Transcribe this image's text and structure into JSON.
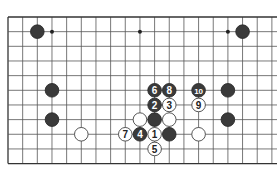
{
  "diagram": {
    "type": "go-board-fragment",
    "grid": {
      "cols": 19,
      "rows": 11,
      "x0": 8,
      "y0": 17,
      "spacing": 14.66,
      "line_color": "#555555",
      "edge_color": "#333333"
    },
    "star_points": [
      [
        3,
        1
      ],
      [
        9,
        1
      ],
      [
        15,
        1
      ]
    ],
    "stones": [
      {
        "col": 2,
        "row": 1,
        "color": "black",
        "label": ""
      },
      {
        "col": 16,
        "row": 1,
        "color": "black",
        "label": ""
      },
      {
        "col": 3,
        "row": 5,
        "color": "black",
        "label": ""
      },
      {
        "col": 3,
        "row": 7,
        "color": "black",
        "label": ""
      },
      {
        "col": 5,
        "row": 8,
        "color": "white",
        "label": ""
      },
      {
        "col": 15,
        "row": 5,
        "color": "black",
        "label": ""
      },
      {
        "col": 15,
        "row": 7,
        "color": "black",
        "label": ""
      },
      {
        "col": 13,
        "row": 8,
        "color": "white",
        "label": ""
      },
      {
        "col": 10,
        "row": 5,
        "color": "black",
        "label": "6"
      },
      {
        "col": 11,
        "row": 5,
        "color": "black",
        "label": "8"
      },
      {
        "col": 10,
        "row": 6,
        "color": "black",
        "label": "2"
      },
      {
        "col": 11,
        "row": 6,
        "color": "white",
        "label": "3"
      },
      {
        "col": 9,
        "row": 7,
        "color": "white",
        "label": ""
      },
      {
        "col": 10,
        "row": 7,
        "color": "black",
        "label": ""
      },
      {
        "col": 11,
        "row": 7,
        "color": "white",
        "label": ""
      },
      {
        "col": 8,
        "row": 8,
        "color": "white",
        "label": "7"
      },
      {
        "col": 9,
        "row": 8,
        "color": "black",
        "label": "4"
      },
      {
        "col": 10,
        "row": 8,
        "color": "white",
        "label": "1"
      },
      {
        "col": 11,
        "row": 8,
        "color": "black",
        "label": ""
      },
      {
        "col": 10,
        "row": 9,
        "color": "white",
        "label": "5"
      },
      {
        "col": 13,
        "row": 5,
        "color": "black",
        "label": "10"
      },
      {
        "col": 13,
        "row": 6,
        "color": "white",
        "label": "9"
      }
    ],
    "colors": {
      "black_stone": "#3a3a3a",
      "white_stone": "#ffffff",
      "white_outline": "#444444"
    }
  }
}
